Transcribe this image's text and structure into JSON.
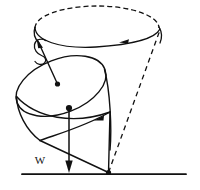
{
  "figure": {
    "background_color": "#ffffff",
    "ink_color": "#111111",
    "width": 200,
    "height": 190
  },
  "labels": {
    "weight": "W"
  },
  "elements": {
    "precession_circle": {
      "name": "precession-path-ellipse",
      "center_x": 97,
      "center_y": 28,
      "radius_x": 62,
      "radius_y": 22,
      "upper_half_style": "dashed",
      "lower_half_style": "solid",
      "dash_pattern": "5,3"
    },
    "top_body": {
      "name": "spinning-top-cone",
      "rim_center_x": 61,
      "rim_center_y": 86,
      "rim_radius_x": 47,
      "rim_radius_y": 27,
      "rim_tilt_degrees": -22,
      "tip_x": 108,
      "tip_y": 173
    },
    "spin_axis": {
      "name": "spin-axis-arrow",
      "from_x": 108,
      "from_y": 173,
      "to_x": 38,
      "to_y": 42,
      "arrowhead": "at-top",
      "marker_dot_x": 57,
      "marker_dot_y": 84
    },
    "weight_vector": {
      "name": "weight-force-arrow",
      "from_x": 69,
      "from_y": 108,
      "to_x": 69,
      "to_y": 173,
      "arrowhead": "at-bottom",
      "origin_dot_x": 69,
      "origin_dot_y": 108
    },
    "spin_curl": {
      "name": "spin-direction-curl",
      "center_x": 38,
      "center_y": 52,
      "description": "small spiral indicating rotation of the top about its own axis"
    },
    "precession_arrowhead": {
      "name": "precession-direction-arrowhead",
      "x": 125,
      "y": 41,
      "direction": "left"
    },
    "body_rotation_arrowhead": {
      "name": "body-rotation-arrowhead",
      "x": 100,
      "y": 118,
      "direction": "left"
    },
    "ground_line": {
      "name": "ground-line",
      "x1": 22,
      "y1": 174,
      "x2": 186,
      "y2": 174
    },
    "pivot_point": {
      "name": "pivot-contact-point",
      "x": 108,
      "y": 173
    },
    "cone_generator_lines": {
      "name": "precession-cone-dashed-generator",
      "from_x": 108,
      "from_y": 173,
      "to_x": 159,
      "to_y": 30,
      "style": "dashed"
    }
  }
}
